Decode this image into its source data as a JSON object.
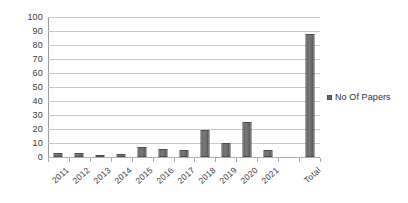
{
  "chart_data": {
    "type": "bar",
    "title": "",
    "subtitle": "",
    "xlabel": "",
    "ylabel": "",
    "categories": [
      "2011",
      "2012",
      "2013",
      "2014",
      "2015",
      "2016",
      "2017",
      "2018",
      "2019",
      "2020",
      "2021",
      "",
      "Total"
    ],
    "values": [
      3,
      3,
      1,
      2,
      7,
      6,
      5,
      19,
      10,
      25,
      5,
      null,
      88
    ],
    "series": [
      {
        "name": "No Of Papers",
        "values": [
          3,
          3,
          1,
          2,
          7,
          6,
          5,
          19,
          10,
          25,
          5,
          null,
          88
        ]
      }
    ],
    "ylim": [
      0,
      100
    ],
    "ytick_step": 10,
    "yticks": [
      0,
      10,
      20,
      30,
      40,
      50,
      60,
      70,
      80,
      90,
      100
    ],
    "grid": true,
    "legend_position": "right",
    "legend": [
      "No Of Papers"
    ],
    "bar_color": "#6a6a6a",
    "gridline_color": "#c9c9c9",
    "axis_color": "#9a9a9a",
    "text_color": "#3d3d3d",
    "background": "#ffffff"
  },
  "legend": {
    "marker": "legend-swatch-icon",
    "label": "No Of Papers"
  }
}
